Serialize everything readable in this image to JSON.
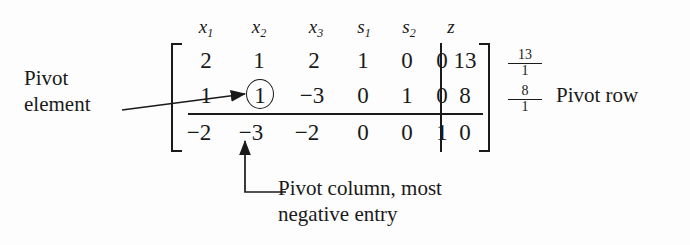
{
  "figure": {
    "type": "simplex-tableau-annotated",
    "column_headers": [
      {
        "base": "x",
        "sub": "1"
      },
      {
        "base": "x",
        "sub": "2"
      },
      {
        "base": "x",
        "sub": "3"
      },
      {
        "base": "s",
        "sub": "1"
      },
      {
        "base": "s",
        "sub": "2"
      },
      {
        "base": "z",
        "sub": ""
      }
    ],
    "matrix": [
      [
        "2",
        "1",
        "2",
        "1",
        "0",
        "0"
      ],
      [
        "1",
        "1",
        "−3",
        "0",
        "1",
        "0"
      ],
      [
        "−2",
        "−3",
        "−2",
        "0",
        "0",
        "1"
      ]
    ],
    "rhs": [
      "13",
      "8",
      "0"
    ],
    "ratios": [
      {
        "num": "13",
        "den": "1"
      },
      {
        "num": "8",
        "den": "1"
      }
    ],
    "pivot": {
      "value": "1",
      "row_index": 1,
      "column_index": 1,
      "circled": true
    },
    "annotations": {
      "pivot_element": {
        "line1": "Pivot",
        "line2": "element"
      },
      "pivot_row": "Pivot row",
      "pivot_column": {
        "line1": "Pivot column, most",
        "line2": "negative entry"
      }
    },
    "colors": {
      "ink": "#1a1a1a",
      "background": "#fdfdfd"
    }
  }
}
